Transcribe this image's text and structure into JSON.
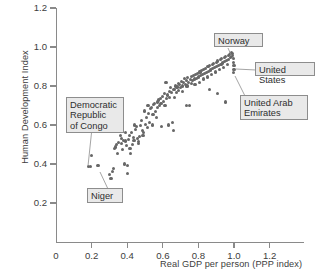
{
  "chart_data": {
    "type": "scatter",
    "title": "",
    "xlabel": "Real GDP per person (PPP index)",
    "ylabel": "Human Development Index",
    "xlim": [
      0,
      1.38
    ],
    "ylim": [
      0,
      1.28
    ],
    "xticks": [
      0,
      0.2,
      0.4,
      0.6,
      0.8,
      1.0,
      1.2
    ],
    "xticklabels": [
      "0",
      "0.2",
      "0.4",
      "0.6",
      "0.8",
      "1.0",
      "1.2"
    ],
    "yticks": [
      0.2,
      0.4,
      0.6,
      0.8,
      1.0,
      1.2
    ],
    "yticklabels": [
      "0.2",
      "0.4",
      "0.6",
      "0.8",
      "1.0",
      "1.2"
    ],
    "grid": false,
    "legend": null,
    "marker_color": "#676767",
    "axis_color": "#8a8a8a",
    "background": "#ffffff",
    "points": [
      [
        0.182,
        0.385
      ],
      [
        0.193,
        0.388
      ],
      [
        0.2,
        0.443
      ],
      [
        0.236,
        0.392
      ],
      [
        0.3,
        0.345
      ],
      [
        0.309,
        0.327
      ],
      [
        0.318,
        0.362
      ],
      [
        0.325,
        0.378
      ],
      [
        0.327,
        0.48
      ],
      [
        0.333,
        0.487
      ],
      [
        0.341,
        0.5
      ],
      [
        0.347,
        0.455
      ],
      [
        0.352,
        0.511
      ],
      [
        0.356,
        0.585
      ],
      [
        0.36,
        0.545
      ],
      [
        0.366,
        0.506
      ],
      [
        0.37,
        0.53
      ],
      [
        0.375,
        0.476
      ],
      [
        0.381,
        0.52
      ],
      [
        0.386,
        0.4
      ],
      [
        0.39,
        0.56
      ],
      [
        0.393,
        0.518
      ],
      [
        0.398,
        0.497
      ],
      [
        0.402,
        0.39
      ],
      [
        0.404,
        0.352
      ],
      [
        0.408,
        0.525
      ],
      [
        0.412,
        0.545
      ],
      [
        0.416,
        0.48
      ],
      [
        0.42,
        0.455
      ],
      [
        0.424,
        0.56
      ],
      [
        0.428,
        0.5
      ],
      [
        0.433,
        0.535
      ],
      [
        0.438,
        0.52
      ],
      [
        0.442,
        0.6
      ],
      [
        0.447,
        0.575
      ],
      [
        0.452,
        0.592
      ],
      [
        0.457,
        0.53
      ],
      [
        0.461,
        0.505
      ],
      [
        0.466,
        0.516
      ],
      [
        0.47,
        0.54
      ],
      [
        0.475,
        0.598
      ],
      [
        0.48,
        0.625
      ],
      [
        0.484,
        0.57
      ],
      [
        0.489,
        0.548
      ],
      [
        0.494,
        0.56
      ],
      [
        0.498,
        0.672
      ],
      [
        0.503,
        0.604
      ],
      [
        0.508,
        0.64
      ],
      [
        0.513,
        0.588
      ],
      [
        0.517,
        0.7
      ],
      [
        0.521,
        0.658
      ],
      [
        0.526,
        0.612
      ],
      [
        0.531,
        0.686
      ],
      [
        0.536,
        0.69
      ],
      [
        0.54,
        0.6
      ],
      [
        0.545,
        0.655
      ],
      [
        0.55,
        0.706
      ],
      [
        0.555,
        0.712
      ],
      [
        0.559,
        0.67
      ],
      [
        0.563,
        0.64
      ],
      [
        0.568,
        0.718
      ],
      [
        0.572,
        0.69
      ],
      [
        0.577,
        0.728
      ],
      [
        0.582,
        0.7
      ],
      [
        0.586,
        0.736
      ],
      [
        0.59,
        0.712
      ],
      [
        0.594,
        0.592
      ],
      [
        0.6,
        0.745
      ],
      [
        0.605,
        0.722
      ],
      [
        0.61,
        0.76
      ],
      [
        0.614,
        0.7
      ],
      [
        0.618,
        0.82
      ],
      [
        0.622,
        0.736
      ],
      [
        0.627,
        0.754
      ],
      [
        0.63,
        0.6
      ],
      [
        0.636,
        0.773
      ],
      [
        0.64,
        0.742
      ],
      [
        0.645,
        0.79
      ],
      [
        0.65,
        0.765
      ],
      [
        0.654,
        0.612
      ],
      [
        0.658,
        0.572
      ],
      [
        0.663,
        0.78
      ],
      [
        0.667,
        0.742
      ],
      [
        0.672,
        0.8
      ],
      [
        0.676,
        0.766
      ],
      [
        0.68,
        0.795
      ],
      [
        0.686,
        0.812
      ],
      [
        0.69,
        0.778
      ],
      [
        0.695,
        0.806
      ],
      [
        0.7,
        0.79
      ],
      [
        0.704,
        0.824
      ],
      [
        0.709,
        0.8
      ],
      [
        0.713,
        0.772
      ],
      [
        0.718,
        0.818
      ],
      [
        0.722,
        0.838
      ],
      [
        0.727,
        0.806
      ],
      [
        0.731,
        0.826
      ],
      [
        0.736,
        0.8
      ],
      [
        0.74,
        0.844
      ],
      [
        0.745,
        0.818
      ],
      [
        0.75,
        0.7
      ],
      [
        0.754,
        0.832
      ],
      [
        0.759,
        0.812
      ],
      [
        0.763,
        0.848
      ],
      [
        0.768,
        0.826
      ],
      [
        0.772,
        0.856
      ],
      [
        0.777,
        0.836
      ],
      [
        0.781,
        0.81
      ],
      [
        0.786,
        0.86
      ],
      [
        0.79,
        0.84
      ],
      [
        0.795,
        0.866
      ],
      [
        0.8,
        0.846
      ],
      [
        0.804,
        0.82
      ],
      [
        0.809,
        0.872
      ],
      [
        0.813,
        0.852
      ],
      [
        0.818,
        0.88
      ],
      [
        0.822,
        0.858
      ],
      [
        0.827,
        0.836
      ],
      [
        0.831,
        0.884
      ],
      [
        0.836,
        0.864
      ],
      [
        0.84,
        0.892
      ],
      [
        0.845,
        0.87
      ],
      [
        0.85,
        0.846
      ],
      [
        0.854,
        0.898
      ],
      [
        0.858,
        0.876
      ],
      [
        0.863,
        0.904
      ],
      [
        0.868,
        0.882
      ],
      [
        0.872,
        0.86
      ],
      [
        0.877,
        0.908
      ],
      [
        0.881,
        0.888
      ],
      [
        0.886,
        0.916
      ],
      [
        0.89,
        0.894
      ],
      [
        0.895,
        0.872
      ],
      [
        0.9,
        0.92
      ],
      [
        0.904,
        0.9
      ],
      [
        0.909,
        0.928
      ],
      [
        0.913,
        0.906
      ],
      [
        0.918,
        0.884
      ],
      [
        0.922,
        0.934
      ],
      [
        0.927,
        0.912
      ],
      [
        0.931,
        0.94
      ],
      [
        0.936,
        0.918
      ],
      [
        0.94,
        0.896
      ],
      [
        0.945,
        0.946
      ],
      [
        0.949,
        0.924
      ],
      [
        0.954,
        0.952
      ],
      [
        0.958,
        0.93
      ],
      [
        0.963,
        0.908
      ],
      [
        0.967,
        0.958
      ],
      [
        0.97,
        0.936
      ],
      [
        0.974,
        0.962
      ],
      [
        0.978,
        0.944
      ],
      [
        0.981,
        0.968
      ],
      [
        0.985,
        0.95
      ],
      [
        0.988,
        0.972
      ],
      [
        0.991,
        0.956
      ],
      [
        0.994,
        0.965
      ],
      [
        0.997,
        0.94
      ],
      [
        0.998,
        0.922
      ],
      [
        1.0,
        0.903
      ],
      [
        1.0,
        0.885
      ],
      [
        0.996,
        0.868
      ],
      [
        0.612,
        0.7
      ],
      [
        0.732,
        0.7
      ],
      [
        0.952,
        0.718
      ],
      [
        0.862,
        0.78
      ],
      [
        0.905,
        0.76
      ]
    ],
    "annotations": [
      {
        "id": "norway",
        "label": "Norway",
        "point": [
          0.985,
          0.968
        ]
      },
      {
        "id": "united-states",
        "label": "United States",
        "point": [
          1.0,
          0.903
        ]
      },
      {
        "id": "united-arab-emirates",
        "label": "United Arab\nEmirates",
        "point": [
          0.996,
          0.868
        ]
      },
      {
        "id": "democratic-republic-of-congo",
        "label": "Democratic\nRepublic\nof Congo",
        "point": [
          0.182,
          0.385
        ]
      },
      {
        "id": "niger",
        "label": "Niger",
        "point": [
          0.309,
          0.327
        ]
      }
    ]
  },
  "axes": {
    "y_title": "Human Development Index",
    "x_title": "Real GDP per person (PPP index)",
    "y_ticklabels": [
      "1.2",
      "1.0",
      "0.8",
      "0.6",
      "0.4",
      "0.2"
    ],
    "x_ticklabels": [
      "0",
      "0.2",
      "0.4",
      "0.6",
      "0.8",
      "1.0",
      "1.2"
    ]
  },
  "callouts": {
    "norway": "Norway",
    "united_states": "United States",
    "united_arab_emirates": "United Arab\nEmirates",
    "democratic_republic_of_congo": "Democratic\nRepublic\nof Congo",
    "niger": "Niger"
  }
}
